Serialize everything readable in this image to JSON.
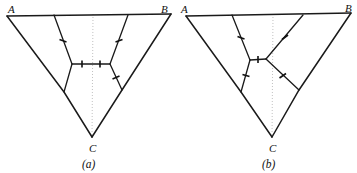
{
  "figure": {
    "background": "#ffffff",
    "ink_color": "#1a1a1a",
    "axis_color": "#b9b9b9",
    "width": 357,
    "height": 173
  },
  "panels": [
    {
      "id": "a",
      "caption": "(a)",
      "caption_pos": {
        "x": 89,
        "y": 168
      },
      "vertices": [
        {
          "name": "A",
          "label": "A",
          "label_x": 8,
          "label_y": 13,
          "x": 7,
          "y": 16
        },
        {
          "name": "B",
          "label": "B",
          "label_x": 161,
          "label_y": 13,
          "x": 171,
          "y": 14
        },
        {
          "name": "C",
          "label": "C",
          "label_x": 89,
          "label_y": 152,
          "x": 92,
          "y": 137
        }
      ],
      "axis": {
        "x1": 93,
        "y1": 14,
        "x2": 92,
        "y2": 139
      },
      "steiner_points": [
        {
          "name": "S1",
          "x": 72,
          "y": 64
        },
        {
          "name": "S2",
          "x": 110,
          "y": 64
        },
        {
          "name": "S3",
          "x": 64,
          "y": 92
        },
        {
          "name": "S4",
          "x": 122,
          "y": 90
        }
      ],
      "edges": [
        {
          "name": "edge-A-B-top",
          "from": [
            7,
            16
          ],
          "to": [
            171,
            14
          ],
          "tick": null
        },
        {
          "name": "edge-S1-S2",
          "from": [
            72,
            64
          ],
          "to": [
            110,
            64
          ],
          "tick": {
            "x": 91,
            "y": 64,
            "angle": 0
          }
        },
        {
          "name": "edge-S1-top",
          "from": [
            72,
            64
          ],
          "to": [
            54,
            15
          ],
          "tick": {
            "x": 63,
            "y": 40,
            "angle": 70
          }
        },
        {
          "name": "edge-S2-top",
          "from": [
            110,
            64
          ],
          "to": [
            128,
            15
          ],
          "tick": {
            "x": 119,
            "y": 40,
            "angle": 110
          }
        },
        {
          "name": "edge-S1-S3",
          "from": [
            72,
            64
          ],
          "to": [
            64,
            92
          ],
          "tick": null
        },
        {
          "name": "edge-S2-S4",
          "from": [
            110,
            64
          ],
          "to": [
            122,
            90
          ],
          "tick": {
            "x": 116,
            "y": 77,
            "angle": 115
          }
        },
        {
          "name": "edge-A-S3-C",
          "from": [
            7,
            16
          ],
          "to": [
            64,
            92
          ],
          "to2": [
            92,
            137
          ],
          "tick": null
        },
        {
          "name": "edge-B-S4-C",
          "from": [
            171,
            14
          ],
          "to": [
            122,
            90
          ],
          "to2": [
            92,
            137
          ],
          "tick": null
        }
      ]
    },
    {
      "id": "b",
      "caption": "(b)",
      "caption_pos": {
        "x": 268,
        "y": 168
      },
      "vertices": [
        {
          "name": "A",
          "label": "A",
          "label_x": 181,
          "label_y": 13,
          "x": 186,
          "y": 16
        },
        {
          "name": "B",
          "label": "B",
          "label_x": 345,
          "label_y": 12,
          "x": 351,
          "y": 13
        },
        {
          "name": "C",
          "label": "C",
          "label_x": 268,
          "label_y": 152,
          "x": 272,
          "y": 137
        }
      ],
      "axis": {
        "x1": 273,
        "y1": 14,
        "x2": 272,
        "y2": 139
      },
      "steiner_points": [
        {
          "name": "S1",
          "x": 250,
          "y": 60
        },
        {
          "name": "S2",
          "x": 266,
          "y": 59
        },
        {
          "name": "S3",
          "x": 241,
          "y": 92
        },
        {
          "name": "S4",
          "x": 299,
          "y": 90
        }
      ],
      "edges": [
        {
          "name": "edge-A-B-top",
          "from": [
            186,
            16
          ],
          "to": [
            351,
            13
          ],
          "tick": null
        },
        {
          "name": "edge-S1-S2",
          "from": [
            250,
            60
          ],
          "to": [
            266,
            59
          ],
          "tick": {
            "x": 258,
            "y": 60,
            "angle": 0
          }
        },
        {
          "name": "edge-S1-top",
          "from": [
            250,
            60
          ],
          "to": [
            232,
            15
          ],
          "tick": {
            "x": 241,
            "y": 37,
            "angle": 68
          }
        },
        {
          "name": "edge-S2-top",
          "from": [
            266,
            59
          ],
          "to": [
            303,
            15
          ],
          "tick": {
            "x": 285,
            "y": 37,
            "angle": 130
          }
        },
        {
          "name": "edge-S1-S3",
          "from": [
            250,
            60
          ],
          "to": [
            241,
            92
          ],
          "tick": {
            "x": 246,
            "y": 76,
            "angle": 74
          }
        },
        {
          "name": "edge-S2-S4",
          "from": [
            266,
            59
          ],
          "to": [
            299,
            90
          ],
          "tick": {
            "x": 283,
            "y": 75,
            "angle": 137
          }
        },
        {
          "name": "edge-A-S3-C",
          "from": [
            186,
            16
          ],
          "to": [
            241,
            92
          ],
          "to2": [
            272,
            137
          ],
          "tick": null
        },
        {
          "name": "edge-B-S4-C",
          "from": [
            351,
            13
          ],
          "to": [
            299,
            90
          ],
          "to2": [
            272,
            137
          ],
          "tick": null
        }
      ]
    }
  ]
}
